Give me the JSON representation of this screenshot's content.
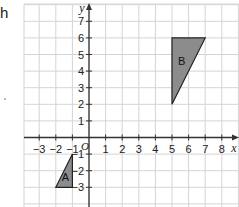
{
  "fragment_text": "h",
  "axes": {
    "x_label": "x",
    "y_label": "y",
    "origin_label": "O",
    "x_ticks": [
      "−3",
      "−2",
      "−1",
      "1",
      "2",
      "3",
      "4",
      "5",
      "6",
      "7",
      "8"
    ],
    "y_ticks": [
      "7",
      "6",
      "5",
      "4",
      "3",
      "2",
      "1",
      "−1",
      "−2",
      "−3"
    ]
  },
  "shapes": [
    {
      "label": "A",
      "vertices": [
        [
          -1,
          -1
        ],
        [
          -1,
          -3
        ],
        [
          -2,
          -3
        ]
      ],
      "fill": "#8c8c8c"
    },
    {
      "label": "B",
      "vertices": [
        [
          5,
          6
        ],
        [
          7,
          6
        ],
        [
          5,
          2
        ]
      ],
      "fill": "#8c8c8c"
    }
  ],
  "colors": {
    "grid": "#d4d4d4",
    "axis": "#333333",
    "shape_stroke": "#222222"
  },
  "chart_data": {
    "type": "coordinate-grid",
    "xlabel": "x",
    "ylabel": "y",
    "xlim": [
      -4,
      9
    ],
    "ylim": [
      -4,
      8
    ],
    "x_ticks": [
      -3,
      -2,
      -1,
      1,
      2,
      3,
      4,
      5,
      6,
      7,
      8
    ],
    "y_ticks": [
      -3,
      -2,
      -1,
      1,
      2,
      3,
      4,
      5,
      6,
      7
    ],
    "grid": true,
    "shapes": [
      {
        "label": "A",
        "type": "triangle",
        "vertices": [
          [
            -1,
            -1
          ],
          [
            -1,
            -3
          ],
          [
            -2,
            -3
          ]
        ]
      },
      {
        "label": "B",
        "type": "triangle",
        "vertices": [
          [
            5,
            6
          ],
          [
            7,
            6
          ],
          [
            5,
            2
          ]
        ]
      }
    ]
  }
}
